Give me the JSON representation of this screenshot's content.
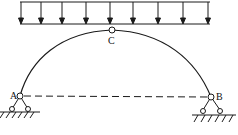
{
  "diagram": {
    "labels": {
      "hinge_crown": "C",
      "support_left": "A",
      "support_right": "B"
    },
    "load": {
      "type": "uniformly-distributed",
      "arrow_count": 9,
      "direction": "down"
    },
    "colors": {
      "stroke": "#1a1a1a",
      "background": "#ffffff"
    }
  }
}
